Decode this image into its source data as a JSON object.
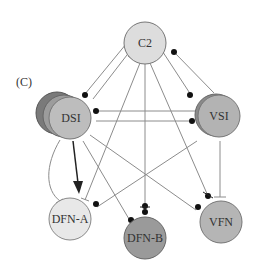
{
  "panel_label": "(C)",
  "colors": {
    "line": "#888888",
    "dark_line": "#222222",
    "dot": "#111111",
    "node_stroke": "#666666",
    "light_fill": "#dddddd",
    "mid_fill": "#b5b5b5",
    "dark_fill": "#8a8a8a",
    "lightest_fill": "#e8e8e8"
  },
  "nodes": {
    "c2": {
      "label": "C2"
    },
    "dsi": {
      "label": "DSI"
    },
    "vsi": {
      "label": "VSI"
    },
    "dfn_a": {
      "label": "DFN-A"
    },
    "dfn_b": {
      "label": "DFN-B"
    },
    "vfn": {
      "label": "VFN"
    }
  },
  "connections": [
    {
      "from": "C2",
      "to": "DSI",
      "type": "inhibitory-dot"
    },
    {
      "from": "DSI",
      "to": "C2",
      "type": "excitatory-bar"
    },
    {
      "from": "C2",
      "to": "VSI",
      "type": "inhibitory-dot"
    },
    {
      "from": "VSI",
      "to": "C2",
      "type": "inhibitory-dot"
    },
    {
      "from": "VSI",
      "to": "DSI",
      "type": "inhibitory-dot"
    },
    {
      "from": "DSI",
      "to": "VSI",
      "type": "inhibitory-dot"
    },
    {
      "from": "DSI",
      "to": "DFN-A",
      "type": "strong-arrow"
    },
    {
      "from": "DSI",
      "to": "DFN-A",
      "type": "excitatory-bar-curve"
    },
    {
      "from": "C2",
      "to": "DFN-A",
      "type": "excitatory-bar"
    },
    {
      "from": "VSI",
      "to": "DFN-A",
      "type": "inhibitory-dot"
    },
    {
      "from": "DSI",
      "to": "DFN-B",
      "type": "inhibitory-dot"
    },
    {
      "from": "C2",
      "to": "DFN-B",
      "type": "mixed"
    },
    {
      "from": "DSI",
      "to": "VFN",
      "type": "inhibitory-dot"
    },
    {
      "from": "C2",
      "to": "VFN",
      "type": "mixed"
    },
    {
      "from": "VSI",
      "to": "VFN",
      "type": "excitatory-bar"
    }
  ]
}
